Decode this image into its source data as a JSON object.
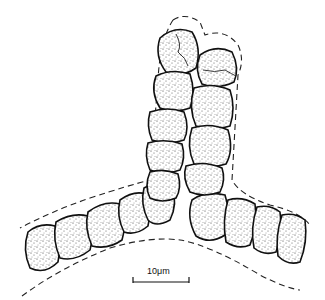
{
  "figure": {
    "scale_bar": {
      "label": "10μm"
    }
  }
}
